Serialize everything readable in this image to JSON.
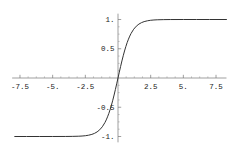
{
  "chart_data": {
    "type": "line",
    "title": "",
    "xlabel": "",
    "ylabel": "",
    "grid": false,
    "legend": null,
    "x_axis": {
      "range": [
        -8.1,
        8.3
      ],
      "ticks": [
        -7.5,
        -5,
        -2.5,
        2.5,
        5,
        7.5
      ],
      "tick_labels": [
        "-7.5",
        "-5.",
        "-2.5",
        "2.5",
        "5.",
        "7.5"
      ],
      "minor_tick_step": 0.625
    },
    "y_axis": {
      "range": [
        -1.1,
        1.1
      ],
      "ticks": [
        -1,
        -0.5,
        0.5,
        1
      ],
      "tick_labels": [
        "-1.",
        "-0.5",
        "0.5",
        "1."
      ],
      "minor_tick_step": 0.125
    },
    "series": [
      {
        "name": "series-1",
        "x": [
          -7.9,
          -7,
          -6,
          -5,
          -4,
          -3.5,
          -3,
          -2.75,
          -2.5,
          -2.25,
          -2,
          -1.8,
          -1.6,
          -1.4,
          -1.2,
          -1.0,
          -0.9,
          -0.8,
          -0.7,
          -0.6,
          -0.5,
          -0.4,
          -0.3,
          -0.2,
          -0.1,
          0,
          0.1,
          0.2,
          0.3,
          0.4,
          0.5,
          0.6,
          0.7,
          0.8,
          0.9,
          1.0,
          1.2,
          1.4,
          1.6,
          1.8,
          2,
          2.25,
          2.5,
          2.75,
          3,
          3.5,
          4,
          5,
          6,
          7,
          8.3
        ],
        "y": [
          -1,
          -1,
          -1,
          -0.9999,
          -0.9993,
          -0.9982,
          -0.9951,
          -0.9919,
          -0.9866,
          -0.978,
          -0.964,
          -0.9468,
          -0.9217,
          -0.8854,
          -0.8337,
          -0.7616,
          -0.7163,
          -0.664,
          -0.6044,
          -0.537,
          -0.4621,
          -0.3799,
          -0.2913,
          -0.1974,
          -0.0997,
          0,
          0.0997,
          0.1974,
          0.2913,
          0.3799,
          0.4621,
          0.537,
          0.6044,
          0.664,
          0.7163,
          0.7616,
          0.8337,
          0.8854,
          0.9217,
          0.9468,
          0.964,
          0.978,
          0.9866,
          0.9919,
          0.9951,
          0.9982,
          0.9993,
          0.9999,
          1,
          1,
          1
        ]
      }
    ],
    "colors": {
      "axis": "#777777",
      "minor_tick": "#999999",
      "curve": "#333333",
      "label": "#1a1a1a",
      "background": "#ffffff"
    }
  }
}
